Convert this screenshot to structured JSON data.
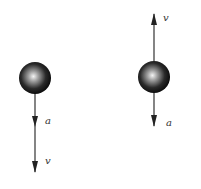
{
  "diagram": {
    "left": {
      "ball": {
        "cx": 35,
        "cy": 78,
        "r": 16
      },
      "arrows": [
        {
          "label": "a",
          "direction": "down"
        },
        {
          "label": "v",
          "direction": "down"
        }
      ]
    },
    "right": {
      "ball": {
        "cx": 154,
        "cy": 77,
        "r": 16
      },
      "arrows": [
        {
          "label": "v",
          "direction": "up"
        },
        {
          "label": "a",
          "direction": "down"
        }
      ]
    },
    "colors": {
      "line": "#333333",
      "ball_dark": "#111111",
      "ball_light": "#f4f4f4"
    }
  }
}
